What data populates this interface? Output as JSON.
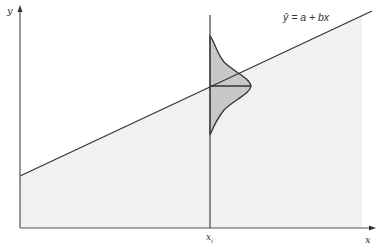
{
  "diagram": {
    "equation_label": "ŷ = a + bx",
    "x_axis_label": "x",
    "y_axis_label": "y",
    "xi_label": "x",
    "xi_subscript": "i",
    "colors": {
      "line": "#333333",
      "region_fill": "#f1f1f1",
      "distribution_fill": "#c8c8c8",
      "axis": "#555555"
    }
  }
}
